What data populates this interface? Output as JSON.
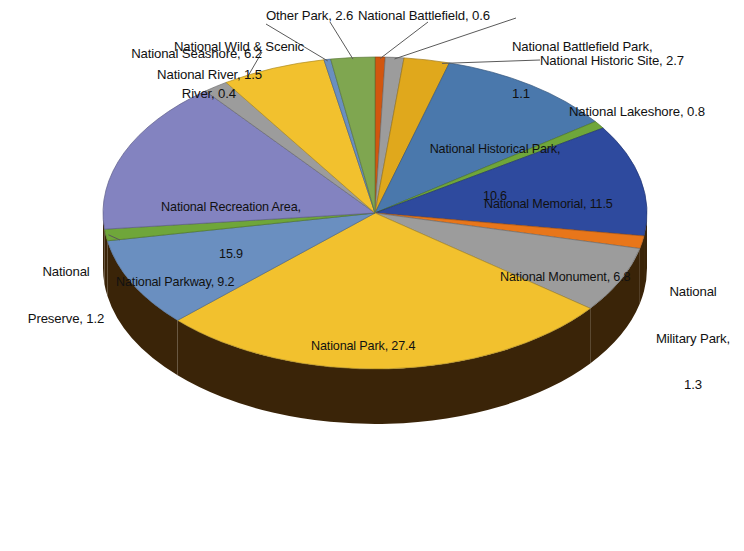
{
  "chart_data": {
    "type": "pie",
    "title": "",
    "subtitle": "",
    "xlabel": "",
    "ylabel": "",
    "grid": false,
    "legend": "none (data labels with leader lines)",
    "style": "3-D exploded-depth pie",
    "value_unit": "percent",
    "label_format": "{name}, {value}",
    "total": 100.0,
    "start_angle_deg": 0,
    "direction": "clockwise",
    "categories": [
      "National Battlefield",
      "National Battlefield Park",
      "National Historic Site",
      "National Historical Park",
      "National Lakeshore",
      "National Memorial",
      "National Military Park",
      "National Monument",
      "National Park",
      "National Parkway",
      "National Preserve",
      "National Recreation Area",
      "National River",
      "National Seashore",
      "National Wild & Scenic River",
      "Other Park"
    ],
    "values": [
      0.6,
      1.1,
      2.7,
      10.6,
      0.8,
      11.5,
      1.3,
      6.8,
      27.4,
      9.2,
      1.2,
      15.9,
      1.5,
      6.2,
      0.4,
      2.6
    ],
    "colors": [
      "#D2560E",
      "#9C9C9C",
      "#E0A81C",
      "#4A78AC",
      "#6FA63A",
      "#2E4A9E",
      "#E8761A",
      "#9C9C9C",
      "#F2C12E",
      "#6A8FC0",
      "#6FA63A",
      "#8383C0",
      "#9C9C9C",
      "#F2C12E",
      "#6A8FC0",
      "#7FA650"
    ],
    "slices": [
      {
        "name": "National Battlefield",
        "value": 0.6,
        "color": "#D2560E",
        "label": "National Battlefield, 0.6"
      },
      {
        "name": "National Battlefield Park",
        "value": 1.1,
        "color": "#9C9C9C",
        "label": "National Battlefield Park, 1.1"
      },
      {
        "name": "National Historic Site",
        "value": 2.7,
        "color": "#E0A81C",
        "label": "National Historic Site, 2.7"
      },
      {
        "name": "National Historical Park",
        "value": 10.6,
        "color": "#4A78AC",
        "label": "National Historical Park, 10.6"
      },
      {
        "name": "National Lakeshore",
        "value": 0.8,
        "color": "#6FA63A",
        "label": "National Lakeshore, 0.8"
      },
      {
        "name": "National Memorial",
        "value": 11.5,
        "color": "#2E4A9E",
        "label": "National Memorial, 11.5"
      },
      {
        "name": "National Military Park",
        "value": 1.3,
        "color": "#E8761A",
        "label": "National Military Park, 1.3"
      },
      {
        "name": "National Monument",
        "value": 6.8,
        "color": "#9C9C9C",
        "label": "National Monument, 6.8"
      },
      {
        "name": "National Park",
        "value": 27.4,
        "color": "#F2C12E",
        "label": "National Park, 27.4"
      },
      {
        "name": "National Parkway",
        "value": 9.2,
        "color": "#6A8FC0",
        "label": "National Parkway, 9.2"
      },
      {
        "name": "National Preserve",
        "value": 1.2,
        "color": "#6FA63A",
        "label": "National Preserve, 1.2"
      },
      {
        "name": "National Recreation Area",
        "value": 15.9,
        "color": "#8383C0",
        "label": "National Recreation Area, 15.9"
      },
      {
        "name": "National River",
        "value": 1.5,
        "color": "#9C9C9C",
        "label": "National River, 1.5"
      },
      {
        "name": "National Seashore",
        "value": 6.2,
        "color": "#F2C12E",
        "label": "National Seashore, 6.2"
      },
      {
        "name": "National Wild & Scenic River",
        "value": 0.4,
        "color": "#6A8FC0",
        "label": "National Wild & Scenic River, 0.4"
      },
      {
        "name": "Other Park",
        "value": 2.6,
        "color": "#7FA650",
        "label": "Other Park, 2.6"
      }
    ]
  },
  "labels": {
    "wild_scenic_river_l1": "National Wild & Scenic",
    "wild_scenic_river_l2": "River, 0.4",
    "seashore": "National Seashore, 6.2",
    "river": "National River, 1.5",
    "other_park": "Other Park, 2.6",
    "battlefield": "National Battlefield, 0.6",
    "battlefield_park_l1": "National Battlefield Park,",
    "battlefield_park_l2": "1.1",
    "historic_site": "National Historic Site, 2.7",
    "lakeshore": "National Lakeshore, 0.8",
    "historical_park_l1": "National Historical Park,",
    "historical_park_l2": "10.6",
    "memorial": "National Memorial, 11.5",
    "military_park_l1": "National",
    "military_park_l2": "Military Park,",
    "military_park_l3": "1.3",
    "monument": "National Monument, 6.8",
    "park": "National Park, 27.4",
    "parkway": "National Parkway, 9.2",
    "preserve_l1": "National",
    "preserve_l2": "Preserve, 1.2",
    "recreation_area_l1": "National Recreation Area,",
    "recreation_area_l2": "15.9"
  },
  "geometry": {
    "center_x": 375,
    "center_y": 213,
    "radius_x": 272,
    "radius_y": 156,
    "depth": 55,
    "side_color": "#3A2408"
  }
}
